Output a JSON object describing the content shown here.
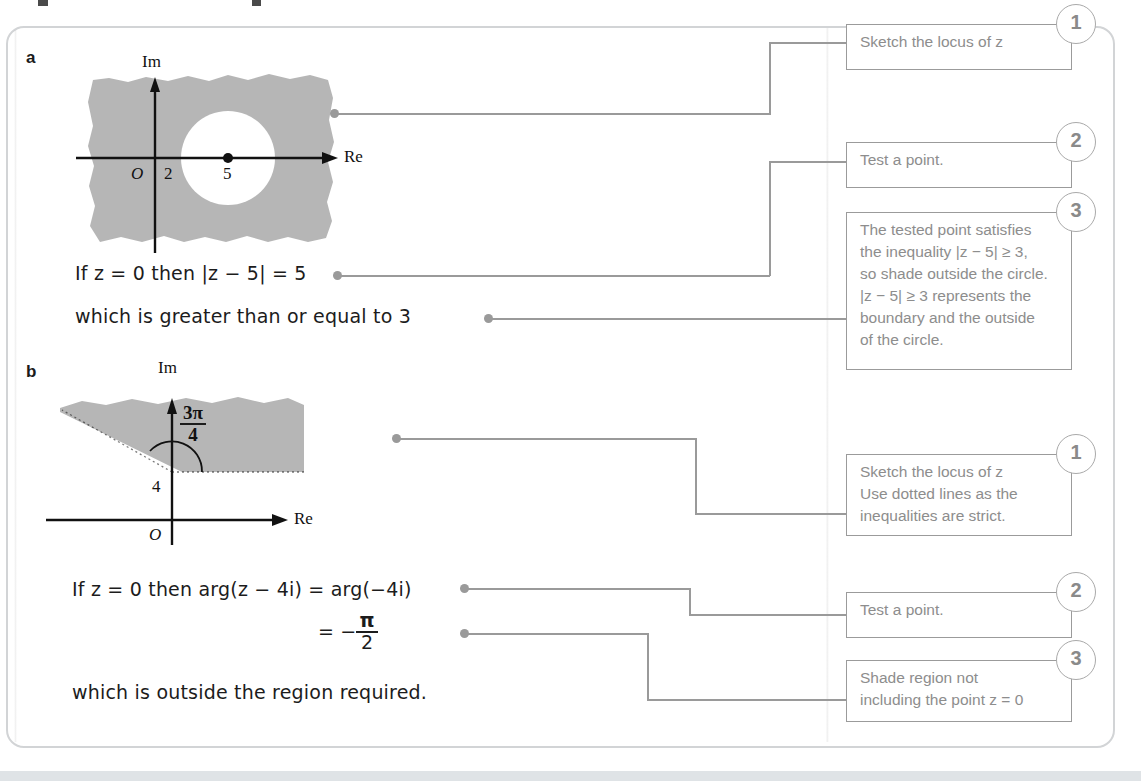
{
  "page": {
    "width": 1141,
    "height": 781,
    "background": "#ffffff",
    "panel_border_color": "#d2d4d6",
    "callout_border_color": "#9b9b9b",
    "callout_text_color": "#8d8d8d",
    "connector_color": "#9a9a9a",
    "shading_color": "#b4b4b4",
    "ink_color": "#1c1c1c"
  },
  "parts": [
    {
      "id": "a",
      "label": "a"
    },
    {
      "id": "b",
      "label": "b"
    }
  ],
  "diagram_a": {
    "name": "argand-diagram-a",
    "im_axis_label": "Im",
    "re_axis_label": "Re",
    "origin_label": "O",
    "tick_labels": [
      "2",
      "5"
    ],
    "centre_label": "5",
    "centre_value": 5,
    "radius_value": 3,
    "region_description": "Shaded everywhere outside the circle of radius 3 centred at 5",
    "circle_boundary": "solid"
  },
  "diagram_b": {
    "name": "argand-diagram-b",
    "im_axis_label": "Im",
    "re_axis_label": "Re",
    "origin_label": "O",
    "point_label": "4",
    "point_value": 4,
    "angle_numerator": "3π",
    "angle_denominator": "4",
    "angle_label": "3π/4",
    "region_description": "Shaded region above the half-line from 4i at angle 3π/4, boundaries dotted",
    "boundary_style": "dotted"
  },
  "working_a": {
    "line1_prefix": "If ",
    "line1_z": "z",
    "line1_mid": " = 0 then |",
    "line1_z2": "z",
    "line1_suffix": " − 5| = 5",
    "line1_plain": "If z = 0 then |z − 5| = 5",
    "line2": "which is greater than or equal to 3"
  },
  "working_b": {
    "line1_plain": "If z = 0 then arg(z − 4i) = arg(−4i)",
    "line2_equals": "= −",
    "line2_numerator": "π",
    "line2_denominator": "2",
    "line2_plain": "= −π/2",
    "line3": "which is outside the region required."
  },
  "callouts_a": [
    {
      "number": "1",
      "name": "callout-a-1",
      "lines": [
        "Sketch the locus of z"
      ],
      "text": "Sketch the locus of z"
    },
    {
      "number": "2",
      "name": "callout-a-2",
      "lines": [
        "Test a point."
      ],
      "text": "Test a point."
    },
    {
      "number": "3",
      "name": "callout-a-3",
      "lines": [
        "The tested point satisfies",
        "the inequality |z − 5| ≥ 3,",
        "so shade outside the circle.",
        "|z − 5| ≥ 3 represents the",
        "boundary and the outside",
        "of the circle."
      ],
      "text": "The tested point satisfies the inequality |z − 5| ≥ 3, so shade outside the circle. |z − 5| ≥ 3 represents the boundary and the outside of the circle."
    }
  ],
  "callouts_b": [
    {
      "number": "1",
      "name": "callout-b-1",
      "lines": [
        "Sketch the locus of z",
        "Use dotted lines as the",
        "inequalities are strict."
      ],
      "text": "Sketch the locus of z Use dotted lines as the inequalities are strict."
    },
    {
      "number": "2",
      "name": "callout-b-2",
      "lines": [
        "Test a point."
      ],
      "text": "Test a point."
    },
    {
      "number": "3",
      "name": "callout-b-3",
      "lines": [
        "Shade region not",
        "including the point z = 0"
      ],
      "text": "Shade region not including the point z = 0"
    }
  ]
}
